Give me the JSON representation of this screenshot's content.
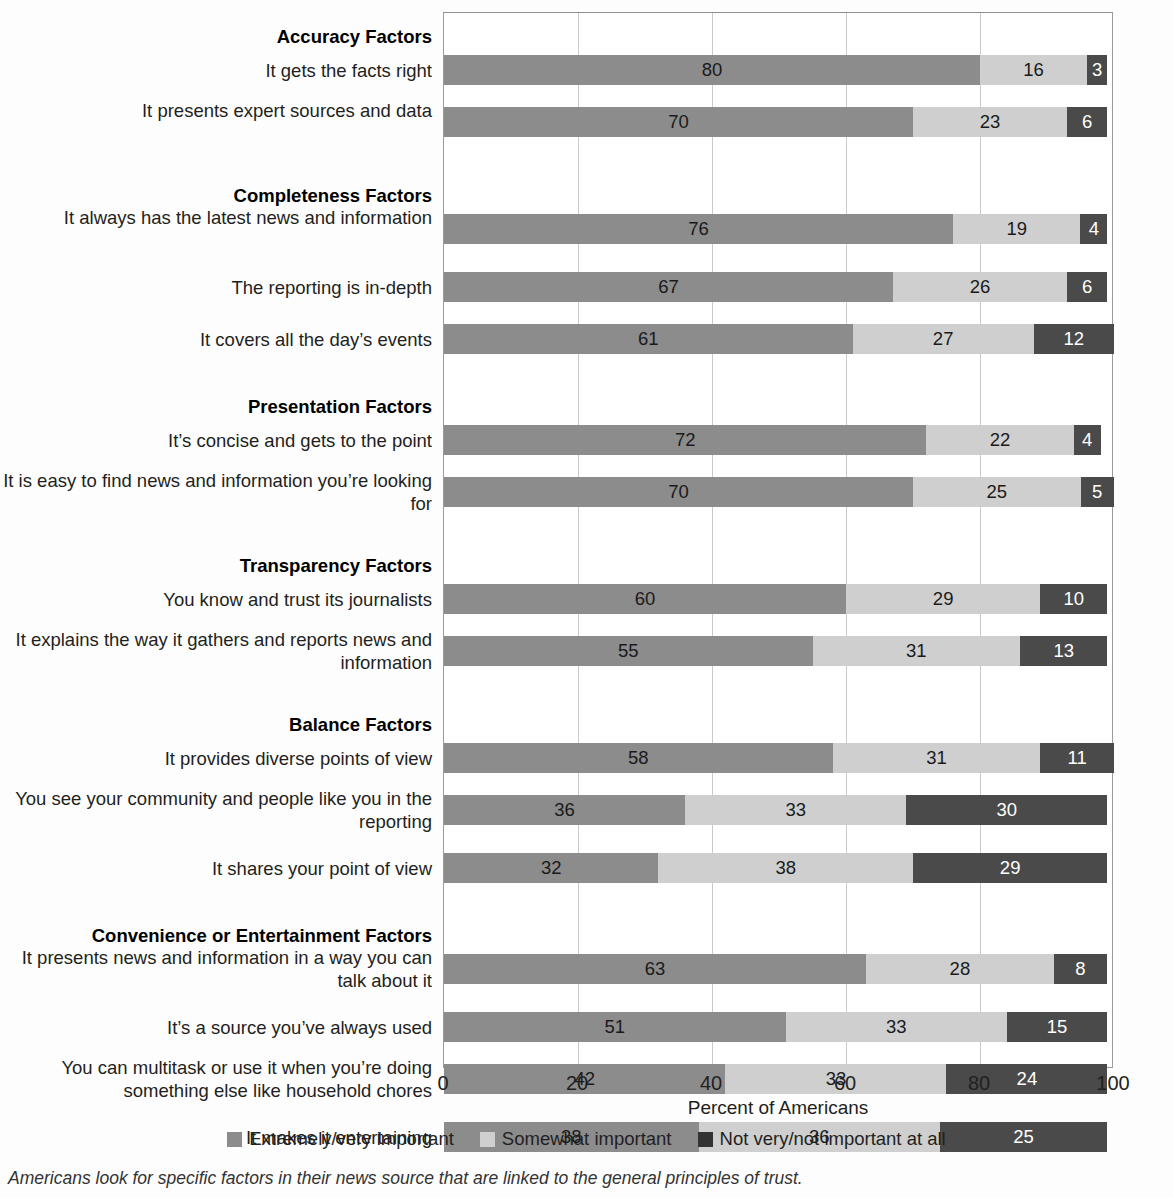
{
  "chart_data": {
    "type": "bar",
    "subtype": "stacked-horizontal-100",
    "title": "",
    "xlabel": "Percent of Americans",
    "ylabel": "",
    "xlim": [
      0,
      100
    ],
    "xticks": [
      "0",
      "20",
      "40",
      "60",
      "80",
      "100"
    ],
    "grid": true,
    "legend_position": "bottom",
    "series": [
      {
        "name": "Extremely/very important",
        "color": "#8c8c8c"
      },
      {
        "name": "Somewhat important",
        "color": "#cfcfcf"
      },
      {
        "name": "Not very/not important at all",
        "color": "#333333"
      }
    ],
    "groups": [
      {
        "header": "Accuracy Factors",
        "rows": [
          {
            "label": "It gets the facts right",
            "values": [
              80,
              16,
              3
            ]
          },
          {
            "label": "It presents expert sources and data",
            "values": [
              70,
              23,
              6
            ]
          }
        ]
      },
      {
        "header": "Completeness Factors",
        "rows": [
          {
            "label": "It always has the latest news and information",
            "values": [
              76,
              19,
              4
            ]
          },
          {
            "label": "The reporting is in-depth",
            "values": [
              67,
              26,
              6
            ]
          },
          {
            "label": "It covers all the day’s events",
            "values": [
              61,
              27,
              12
            ]
          }
        ]
      },
      {
        "header": "Presentation Factors",
        "rows": [
          {
            "label": "It’s concise and gets to the point",
            "values": [
              72,
              22,
              4
            ]
          },
          {
            "label": "It is easy to find news and information you’re looking for",
            "values": [
              70,
              25,
              5
            ]
          }
        ]
      },
      {
        "header": "Transparency Factors",
        "rows": [
          {
            "label": "You know and trust its journalists",
            "values": [
              60,
              29,
              10
            ]
          },
          {
            "label": "It explains the way it gathers and reports news and information",
            "values": [
              55,
              31,
              13
            ]
          }
        ]
      },
      {
        "header": "Balance Factors",
        "rows": [
          {
            "label": "It provides diverse points of view",
            "values": [
              58,
              31,
              11
            ]
          },
          {
            "label": "You see your community and people like you in the reporting",
            "values": [
              36,
              33,
              30
            ]
          },
          {
            "label": "It shares your point of view",
            "values": [
              32,
              38,
              29
            ]
          }
        ]
      },
      {
        "header": "Convenience or Entertainment Factors",
        "rows": [
          {
            "label": "It presents news and information in a way you can talk about it",
            "values": [
              63,
              28,
              8
            ]
          },
          {
            "label": "It’s a source you’ve always used",
            "values": [
              51,
              33,
              15
            ]
          },
          {
            "label": "You can multitask or use it when you’re doing something else like household chores",
            "values": [
              42,
              33,
              24
            ]
          },
          {
            "label": "It makes it entertaining",
            "values": [
              38,
              36,
              25
            ]
          }
        ]
      }
    ]
  },
  "caption": "Americans look for specific factors in their news source that are linked to the general principles of trust."
}
